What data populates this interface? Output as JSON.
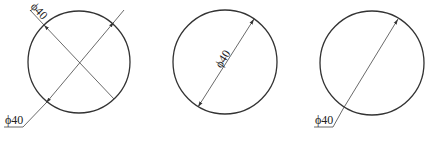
{
  "diagram": {
    "stroke_color": "#333333",
    "background": "#ffffff",
    "figures": [
      {
        "id": "circle-1",
        "label_top": "ϕ40",
        "label_bottom": "ϕ40",
        "description": "Two crossing diameters; one labelled along the line, one with leader"
      },
      {
        "id": "circle-2",
        "label": "ϕ40",
        "description": "Diameter with label placed along the dimension line inside the circle"
      },
      {
        "id": "circle-3",
        "label": "ϕ40",
        "description": "Diameter with single arrow and horizontal leader label outside"
      }
    ]
  }
}
